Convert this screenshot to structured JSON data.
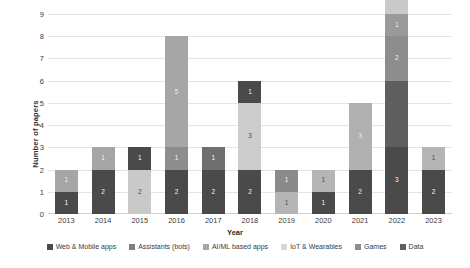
{
  "chart_data": {
    "type": "bar",
    "stacked": true,
    "title": "",
    "xlabel": "Year",
    "ylabel": "Number of papers",
    "ylim": [
      0,
      9
    ],
    "yticks": [
      0,
      1,
      2,
      3,
      4,
      5,
      6,
      7,
      8,
      9
    ],
    "grid": true,
    "legend_position": "bottom",
    "categories": [
      "2013",
      "2014",
      "2015",
      "2016",
      "2017",
      "2018",
      "2019",
      "2020",
      "2021",
      "2022",
      "2023"
    ],
    "series": [
      {
        "name": "Web & Mobile apps",
        "color": "#4a4a4a",
        "values": [
          1,
          2,
          0,
          2,
          2,
          2,
          0,
          1,
          2,
          3,
          2
        ]
      },
      {
        "name": "Assistants (bots)",
        "color": "#a6a6a6",
        "values": [
          1,
          1,
          0,
          1,
          1,
          0,
          0,
          0,
          0,
          0,
          0
        ]
      },
      {
        "name": "AI/ML based apps",
        "color": "#c9c9c9",
        "values": [
          0,
          0,
          2,
          5,
          0,
          3,
          1,
          1,
          3,
          0,
          1
        ]
      },
      {
        "name": "IoT & Wearables",
        "color": "#e8e8e8",
        "values": [
          0,
          0,
          0,
          0,
          0,
          0,
          0,
          0,
          0,
          0,
          0
        ]
      },
      {
        "name": "Games",
        "color": "#808080",
        "values": [
          0,
          0,
          0,
          0,
          0,
          0,
          0,
          0,
          0,
          2,
          0
        ]
      },
      {
        "name": "Data",
        "color": "#5f5f5f",
        "values": [
          0,
          0,
          1,
          0,
          0,
          1,
          1,
          0,
          0,
          3,
          0
        ]
      }
    ],
    "bars": [
      {
        "year": "2013",
        "total": 2,
        "segments": [
          {
            "series": "Web & Mobile apps",
            "value": 1,
            "label": "1",
            "color": "#4a4a4a",
            "tone": "dark"
          },
          {
            "series": "Assistants (bots)",
            "value": 1,
            "label": "1",
            "color": "#a6a6a6",
            "tone": "mid"
          }
        ]
      },
      {
        "year": "2014",
        "total": 3,
        "segments": [
          {
            "series": "Web & Mobile apps",
            "value": 2,
            "label": "2",
            "color": "#4a4a4a",
            "tone": "dark"
          },
          {
            "series": "Assistants (bots)",
            "value": 1,
            "label": "1",
            "color": "#a6a6a6",
            "tone": "mid"
          }
        ]
      },
      {
        "year": "2015",
        "total": 3,
        "segments": [
          {
            "series": "AI/ML based apps",
            "value": 2,
            "label": "2",
            "color": "#c9c9c9",
            "tone": "light"
          },
          {
            "series": "Data",
            "value": 1,
            "label": "1",
            "color": "#4a4a4a",
            "tone": "dark"
          }
        ]
      },
      {
        "year": "2016",
        "total": 8,
        "segments": [
          {
            "series": "Web & Mobile apps",
            "value": 2,
            "label": "2",
            "color": "#4a4a4a",
            "tone": "dark"
          },
          {
            "series": "Assistants (bots)",
            "value": 1,
            "label": "1",
            "color": "#8d8d8d",
            "tone": "mid"
          },
          {
            "series": "AI/ML based apps",
            "value": 5,
            "label": "5",
            "color": "#a6a6a6",
            "tone": "mid"
          }
        ]
      },
      {
        "year": "2017",
        "total": 3,
        "segments": [
          {
            "series": "Web & Mobile apps",
            "value": 2,
            "label": "2",
            "color": "#4a4a4a",
            "tone": "dark"
          },
          {
            "series": "Assistants (bots)",
            "value": 1,
            "label": "1",
            "color": "#6f6f6f",
            "tone": "mid"
          }
        ]
      },
      {
        "year": "2018",
        "total": 6,
        "segments": [
          {
            "series": "Web & Mobile apps",
            "value": 2,
            "label": "2",
            "color": "#4a4a4a",
            "tone": "dark"
          },
          {
            "series": "AI/ML based apps",
            "value": 3,
            "label": "3",
            "color": "#cccccc",
            "tone": "light"
          },
          {
            "series": "Data",
            "value": 1,
            "label": "1",
            "color": "#4a4a4a",
            "tone": "dark"
          }
        ]
      },
      {
        "year": "2019",
        "total": 2,
        "segments": [
          {
            "series": "AI/ML based apps",
            "value": 1,
            "label": "1",
            "color": "#b5b5b5",
            "tone": "light"
          },
          {
            "series": "Data",
            "value": 1,
            "label": "1",
            "color": "#8a8a8a",
            "tone": "mid"
          }
        ]
      },
      {
        "year": "2020",
        "total": 2,
        "segments": [
          {
            "series": "Web & Mobile apps",
            "value": 1,
            "label": "1",
            "color": "#4a4a4a",
            "tone": "dark"
          },
          {
            "series": "AI/ML based apps",
            "value": 1,
            "label": "1",
            "color": "#b5b5b5",
            "tone": "light"
          }
        ]
      },
      {
        "year": "2021",
        "total": 5,
        "segments": [
          {
            "series": "Web & Mobile apps",
            "value": 2,
            "label": "2",
            "color": "#4a4a4a",
            "tone": "dark"
          },
          {
            "series": "AI/ML based apps",
            "value": 3,
            "label": "3",
            "color": "#b0b0b0",
            "tone": "mid"
          }
        ]
      },
      {
        "year": "2022",
        "total": 8,
        "segments": [
          {
            "series": "Web & Mobile apps",
            "value": 3,
            "label": "3",
            "color": "#4a4a4a",
            "tone": "dark"
          },
          {
            "series": "Data",
            "value": 3,
            "label": "",
            "color": "#5f5f5f",
            "tone": "dark"
          },
          {
            "series": "Games",
            "value": 2,
            "label": "2",
            "color": "#8d8d8d",
            "tone": "mid"
          },
          {
            "series": "Assistants (bots)",
            "value": 1,
            "label": "1",
            "color": "#9a9a9a",
            "tone": "mid"
          },
          {
            "series": "AI/ML based apps",
            "value": 2,
            "label": "2",
            "color": "#c9c9c9",
            "tone": "light"
          }
        ]
      },
      {
        "year": "2023",
        "total": 3,
        "segments": [
          {
            "series": "Web & Mobile apps",
            "value": 2,
            "label": "2",
            "color": "#4a4a4a",
            "tone": "dark"
          },
          {
            "series": "AI/ML based apps",
            "value": 1,
            "label": "1",
            "color": "#b5b5b5",
            "tone": "light"
          }
        ]
      }
    ],
    "legend": [
      {
        "label": "Web & Mobile apps",
        "color": "#4a4a4a"
      },
      {
        "label": "Assistants (bots)",
        "color": "#808080"
      },
      {
        "label": "AI/ML based apps",
        "color": "#a8a8a8"
      },
      {
        "label": "IoT & Wearables",
        "color": "#d8d8d8"
      },
      {
        "label": "Games",
        "color": "#8d8d8d"
      },
      {
        "label": "Data",
        "color": "#5f5f5f"
      }
    ]
  }
}
